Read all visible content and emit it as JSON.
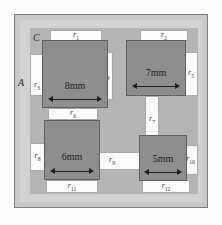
{
  "figure": {
    "background_color": "#fefefe",
    "plate_color": "#c9c9c9",
    "region_a_color": "#d2d2d2",
    "field_color": "#b5b5b5",
    "block_color": "#8e8e8e",
    "route_color": "#fbfbfb"
  },
  "region_labels": [
    {
      "name": "A",
      "text": "A"
    },
    {
      "name": "B",
      "text": "B"
    },
    {
      "name": "C",
      "text": "C"
    },
    {
      "name": "D",
      "text": "D"
    }
  ],
  "blocks": [
    {
      "id": "block-8mm",
      "label": "8mm",
      "size_mm": 8
    },
    {
      "id": "block-7mm",
      "label": "7mm",
      "size_mm": 7
    },
    {
      "id": "block-6mm",
      "label": "6mm",
      "size_mm": 6
    },
    {
      "id": "block-5mm",
      "label": "5mm",
      "size_mm": 5
    }
  ],
  "routes": [
    {
      "id": "r1",
      "base": "r",
      "index": "1"
    },
    {
      "id": "r2",
      "base": "r",
      "index": "2"
    },
    {
      "id": "r3",
      "base": "r",
      "index": "3"
    },
    {
      "id": "r4",
      "base": "r",
      "index": "4"
    },
    {
      "id": "r5",
      "base": "r",
      "index": "5"
    },
    {
      "id": "r6",
      "base": "r",
      "index": "6"
    },
    {
      "id": "r7",
      "base": "r",
      "index": "7"
    },
    {
      "id": "r8",
      "base": "r",
      "index": "8"
    },
    {
      "id": "r9",
      "base": "r",
      "index": "9"
    },
    {
      "id": "r10",
      "base": "r",
      "index": "10"
    },
    {
      "id": "r11",
      "base": "r",
      "index": "11"
    },
    {
      "id": "r12",
      "base": "r",
      "index": "12"
    }
  ]
}
